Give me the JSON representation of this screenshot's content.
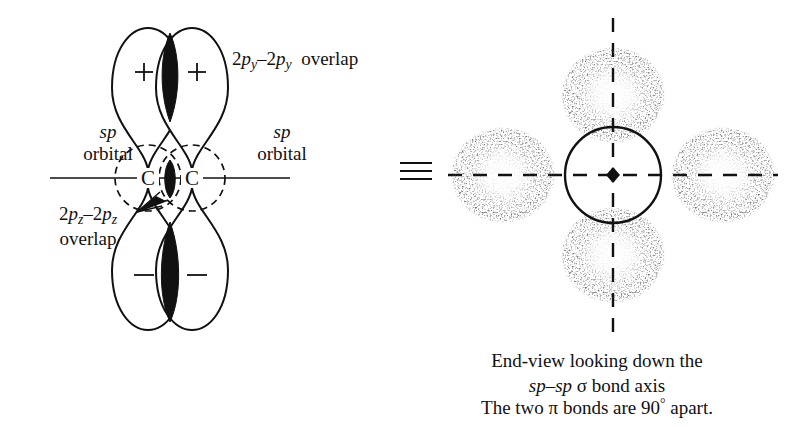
{
  "figure": {
    "background_color": "#ffffff",
    "ink_color": "#111111"
  },
  "left_diagram": {
    "name": "side-view-orbital-overlap",
    "atom_labels": [
      "C",
      "C"
    ],
    "lobe_signs": {
      "top_left": "+",
      "top_right": "+",
      "bottom_left": "−",
      "bottom_right": "−"
    },
    "labels": {
      "py_overlap": {
        "prefix": "2",
        "p1": "p",
        "sub1": "y",
        "dash": "–",
        "prefix2": "2",
        "p2": "p",
        "sub2": "y",
        "suffix": "overlap",
        "full": "2py–2py overlap"
      },
      "pz_overlap": {
        "prefix": "2",
        "p1": "p",
        "sub1": "z",
        "dash": "–",
        "prefix2": "2",
        "p2": "p",
        "sub2": "z",
        "suffix": "overlap",
        "full": "2pz–2pz overlap"
      },
      "sp_orbital_left": {
        "line1": "sp",
        "line2": "orbital"
      },
      "sp_orbital_right": {
        "line1": "sp",
        "line2": "orbital"
      }
    }
  },
  "identity_symbol": {
    "glyph": "≡",
    "meaning": "is equivalent to"
  },
  "right_diagram": {
    "name": "end-view-down-bond-axis",
    "center_marker": "carbon-atom-dot",
    "lobes": [
      "top",
      "bottom",
      "left",
      "right"
    ],
    "axes": [
      "vertical-dashed-axis",
      "horizontal-dashed-axis"
    ]
  },
  "captions": {
    "end_view_line1": "End-view looking down the",
    "end_view_line2_pre": "sp–sp",
    "end_view_line2_sigma": "σ",
    "end_view_line2_post": "bond axis",
    "pi_bonds_pre": "The two",
    "pi_bonds_pi": "π",
    "pi_bonds_mid": "bonds are 90",
    "pi_bonds_deg": "°",
    "pi_bonds_post": "apart.",
    "pi_bonds_full": "The two π bonds are 90° apart."
  }
}
